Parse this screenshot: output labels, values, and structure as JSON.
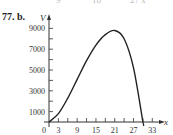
{
  "problem_label": "77. b.",
  "clipped_top_text": [
    "9",
    "18",
    "27 x"
  ],
  "chart_data": {
    "type": "line",
    "title": "",
    "xlabel": "x",
    "ylabel": "V",
    "x_ticks": [
      0,
      3,
      9,
      15,
      21,
      27,
      33
    ],
    "y_ticks": [
      1000,
      3000,
      5000,
      7000,
      9000
    ],
    "xlim": [
      0,
      35
    ],
    "ylim": [
      0,
      9800
    ],
    "grid": false,
    "series": [
      {
        "name": "V(x)",
        "x": [
          0,
          3,
          6,
          9,
          12,
          15,
          18,
          21,
          24,
          27,
          30
        ],
        "values": [
          0,
          800,
          2300,
          4100,
          5900,
          7400,
          8400,
          8800,
          8000,
          5200,
          0
        ]
      }
    ]
  }
}
